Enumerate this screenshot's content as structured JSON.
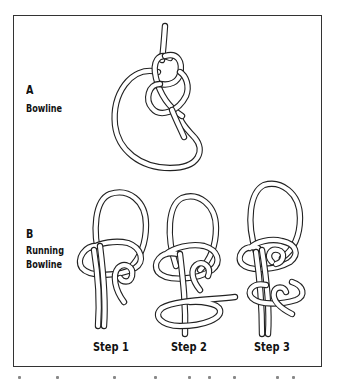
{
  "figure": {
    "panel_a": {
      "letter": "A",
      "title": "Bowline"
    },
    "panel_b": {
      "letter": "B",
      "title_line1": "Running",
      "title_line2": "Bowline",
      "steps": [
        {
          "label": "Step 1"
        },
        {
          "label": "Step 2"
        },
        {
          "label": "Step 3"
        }
      ]
    },
    "colors": {
      "line": "#222222",
      "frame": "#333333",
      "background": "#ffffff"
    }
  }
}
